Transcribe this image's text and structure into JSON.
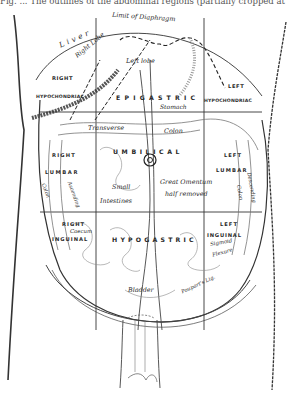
{
  "figure": {
    "caption": "Fig. ... The outlines of the abdominal regions (partially cropped at top)"
  },
  "regions": {
    "right_hypochondriac": [
      "RIGHT",
      "HYPOCHONDRIAC"
    ],
    "epigastric": "EPIGASTRIC",
    "left_hypochondriac": [
      "LEFT",
      "HYPOCHONDRIAC"
    ],
    "right_lumbar": [
      "RIGHT",
      "LUMBAR"
    ],
    "umbilical": "UMBILICAL",
    "left_lumbar": [
      "LEFT",
      "LUMBAR"
    ],
    "right_inguinal": [
      "RIGHT",
      "INGUINAL"
    ],
    "hypogastric": "HYPOGASTRIC",
    "left_inguinal": [
      "LEFT",
      "INGUINAL"
    ]
  },
  "organs": {
    "limit_of_diaphragm": "Limit of Diaphragm",
    "liver": "Liver",
    "right_lobe": "Right Lobe",
    "left_lobe": "Left lobe",
    "stomach": "Stomach",
    "transverse_colon": [
      "Transverse",
      "Colon"
    ],
    "ascending_colon": [
      "Ascending",
      "Colon"
    ],
    "descending_colon": [
      "Descending",
      "Colon"
    ],
    "small_intestines": [
      "Small",
      "Intestines"
    ],
    "great_omentum": [
      "Great Omentum",
      "half removed"
    ],
    "caecum": "Caecum",
    "sigmoid_flexure": [
      "Sigmoid",
      "Flexure"
    ],
    "pouparts_lig": "Poupart's Lig.",
    "bladder": "Bladder"
  },
  "colors": {
    "ink": "#2a2a2a",
    "shade": "#8a8a8a",
    "paper": "#ffffff"
  }
}
